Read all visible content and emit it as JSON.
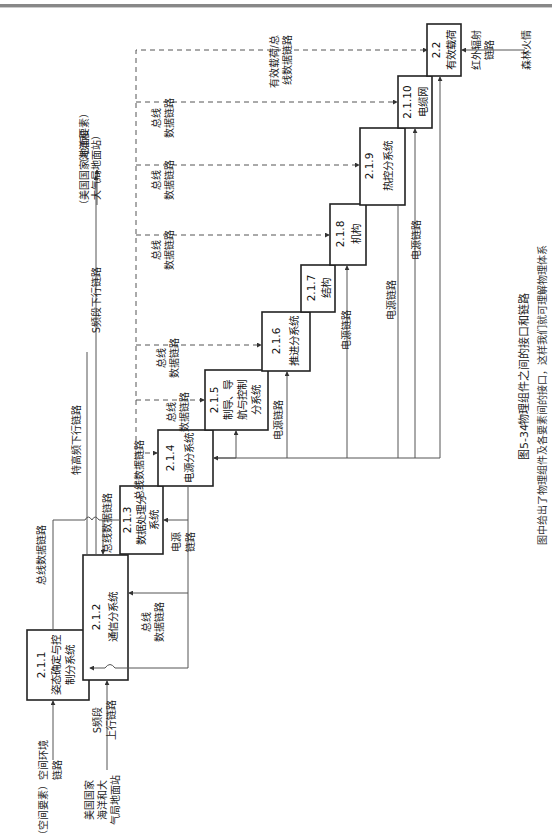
{
  "figure": {
    "number": "图5-34",
    "title": "物理组件之间的接口和链路",
    "subtitle": "图中给出了物理组件及各要素间的接口，这样我们就可理解物理体系"
  },
  "components": [
    {
      "id": "2.1.1",
      "name_l1": "姿态确定与控",
      "name_l2": "制分系统"
    },
    {
      "id": "2.1.2",
      "name_l1": "通信分系统",
      "name_l2": ""
    },
    {
      "id": "2.1.3",
      "name_l1": "数据处理分",
      "name_l2": "系统"
    },
    {
      "id": "2.1.4",
      "name_l1": "电源分系统",
      "name_l2": ""
    },
    {
      "id": "2.1.5",
      "name_l1": "制导、导",
      "name_l2": "航与控制",
      "name_l3": "分系统"
    },
    {
      "id": "2.1.6",
      "name_l1": "推进分系统",
      "name_l2": ""
    },
    {
      "id": "2.1.7",
      "name_l1": "结构",
      "name_l2": ""
    },
    {
      "id": "2.1.8",
      "name_l1": "机构",
      "name_l2": ""
    },
    {
      "id": "2.1.9",
      "name_l1": "热控分系统",
      "name_l2": ""
    },
    {
      "id": "2.1.10",
      "name_l1": "电缆网",
      "name_l2": ""
    },
    {
      "id": "2.2",
      "name_l1": "有效载荷",
      "name_l2": ""
    }
  ],
  "external": {
    "space_env": "（空间要素）空间环境",
    "space_env_l2": "链路",
    "noaa_ground_l1": "美国国家",
    "noaa_ground_l2": "海洋和大",
    "noaa_ground_l3": "气局地面站",
    "s_uplink_l1": "S频段",
    "s_uplink_l2": "上行链路",
    "s_downlink": "S频段下行链路",
    "ground_element": "（地面要素）",
    "noaa_ground_right_l1": "（美国国家海洋和",
    "noaa_ground_right_l2": "大气局地面站）",
    "hr_downlink": "特高频下行链路",
    "ir_link_l1": "红外辐射",
    "ir_link_l2": "链路",
    "forest_fire": "森林火情"
  },
  "links": {
    "bus_data": "总线数据链路",
    "bus_l1": "总线",
    "bus_l2": "数据链路",
    "power": "电源链路",
    "power_l1": "电源",
    "power_l2": "链路",
    "payload_bus_l1": "有效载荷/总",
    "payload_bus_l2": "线数据链路"
  }
}
